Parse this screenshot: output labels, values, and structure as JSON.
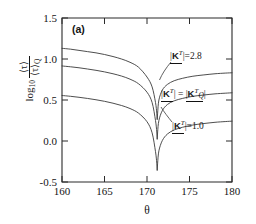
{
  "figure": {
    "panel_label": "(a)",
    "background": "#ffffff",
    "curve_color": "#3a3a3a",
    "axis_color": "#2b2b2b"
  },
  "annotations": [
    {
      "id": "top",
      "text_plain": "|K^T| = 2.8",
      "value": "2.8",
      "x_px": 170,
      "y_px": 56
    },
    {
      "id": "middle",
      "text_plain": "|K^T| = |K^T_Q|",
      "value": "",
      "x_px": 162,
      "y_px": 93
    },
    {
      "id": "bottom",
      "text_plain": "|K^T| = 1.0",
      "value": "1.0",
      "x_px": 172,
      "y_px": 126
    }
  ],
  "chart_data": {
    "type": "line",
    "title": "",
    "subtitle": "",
    "panel": "(a)",
    "xlabel": "θ",
    "ylabel": "log10 ⟨τ⟩ / ⟨τ⟩_Q",
    "xlim": [
      160,
      180
    ],
    "ylim": [
      -0.5,
      1.5
    ],
    "xticks": [
      160,
      165,
      170,
      175,
      180
    ],
    "yticks": [
      -0.5,
      0.0,
      0.5,
      1.0,
      1.5
    ],
    "xticklabels": [
      "160",
      "165",
      "170",
      "175",
      "180"
    ],
    "yticklabels": [
      "-0.5",
      "0.0",
      "0.5",
      "1.0",
      "1.5"
    ],
    "grid": false,
    "legend": "inline-annotations",
    "cusp_theta": 171.2,
    "series": [
      {
        "name": "|K^T| = 2.8",
        "label": "2.8",
        "cusp_min": 0.26,
        "x": [
          160,
          161,
          162,
          163,
          164,
          165,
          166,
          167,
          168,
          169,
          170,
          170.6,
          171.0,
          171.15,
          171.2,
          171.25,
          171.4,
          171.8,
          172.4,
          173.2,
          174.2,
          175.4,
          176.6,
          178.0,
          179.2,
          180
        ],
        "y": [
          1.13,
          1.12,
          1.105,
          1.09,
          1.075,
          1.055,
          1.03,
          1.0,
          0.96,
          0.9,
          0.78,
          0.66,
          0.47,
          0.34,
          0.26,
          0.34,
          0.5,
          0.62,
          0.69,
          0.735,
          0.765,
          0.79,
          0.805,
          0.82,
          0.828,
          0.832
        ]
      },
      {
        "name": "|K^T| = |K^T_Q|",
        "label": "Q-matched",
        "cusp_min": 0.02,
        "x": [
          160,
          161,
          162,
          163,
          164,
          165,
          166,
          167,
          168,
          169,
          170,
          170.6,
          171.0,
          171.15,
          171.2,
          171.25,
          171.4,
          171.8,
          172.4,
          173.2,
          174.2,
          175.4,
          176.6,
          178.0,
          179.2,
          180
        ],
        "y": [
          0.915,
          0.905,
          0.893,
          0.878,
          0.862,
          0.843,
          0.82,
          0.792,
          0.754,
          0.698,
          0.595,
          0.47,
          0.25,
          0.11,
          0.02,
          0.11,
          0.25,
          0.37,
          0.445,
          0.49,
          0.52,
          0.545,
          0.56,
          0.575,
          0.583,
          0.588
        ]
      },
      {
        "name": "|K^T| = 1.0",
        "label": "1.0",
        "cusp_min": -0.36,
        "x": [
          160,
          161,
          162,
          163,
          164,
          165,
          166,
          167,
          168,
          169,
          170,
          170.6,
          171.0,
          171.15,
          171.2,
          171.25,
          171.4,
          171.8,
          172.4,
          173.2,
          174.2,
          175.4,
          176.6,
          178.0,
          179.2,
          180
        ],
        "y": [
          0.555,
          0.545,
          0.533,
          0.519,
          0.503,
          0.484,
          0.461,
          0.433,
          0.396,
          0.34,
          0.235,
          0.1,
          -0.13,
          -0.27,
          -0.36,
          -0.27,
          -0.12,
          0.005,
          0.085,
          0.135,
          0.168,
          0.195,
          0.212,
          0.228,
          0.237,
          0.242
        ]
      }
    ]
  }
}
